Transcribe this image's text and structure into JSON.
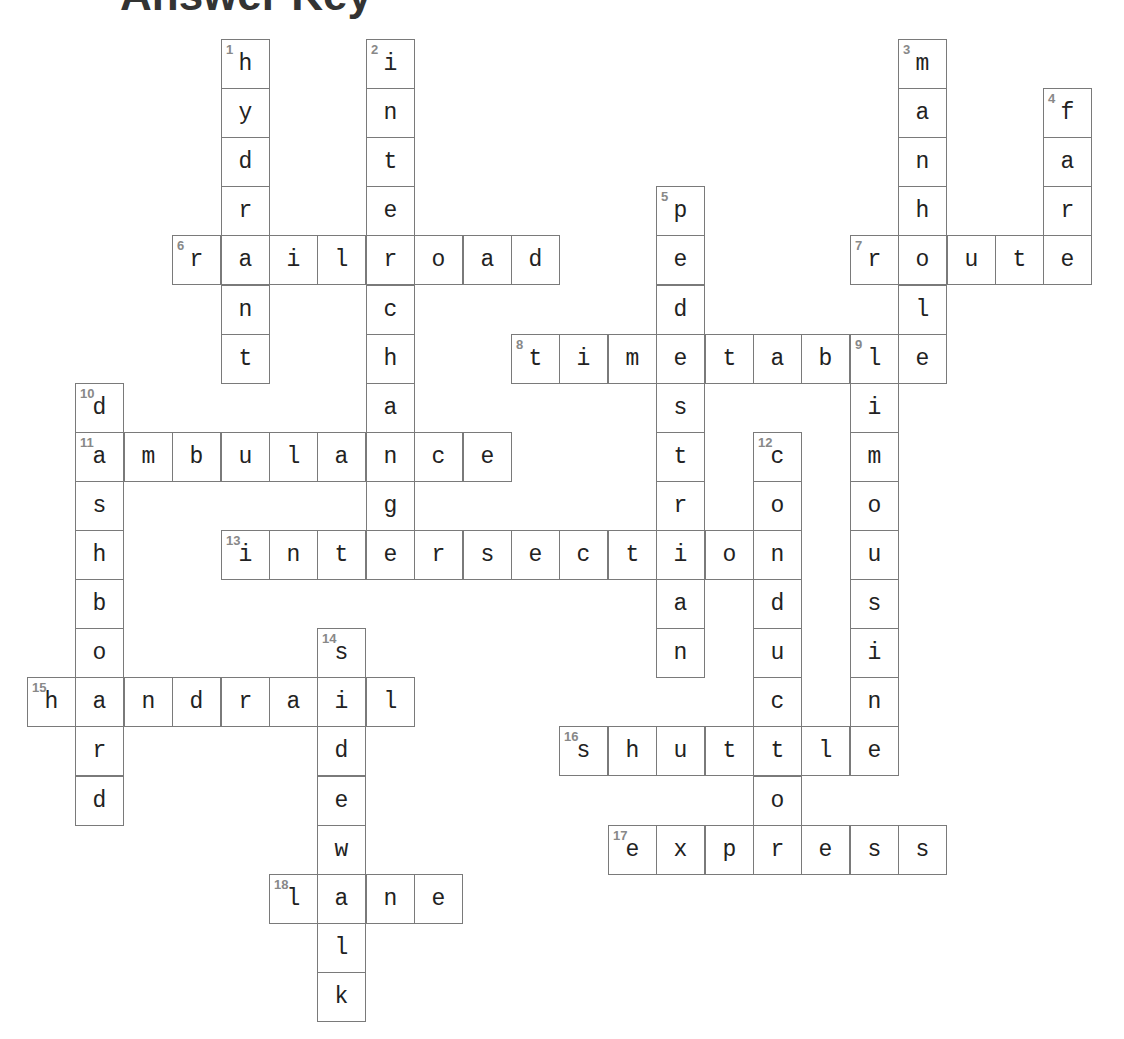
{
  "header": {
    "title_fragment": "Answer Key"
  },
  "grid": {
    "origin_x": 27,
    "origin_y": 39,
    "col_pitch": 48.4,
    "row_pitch": 49.1,
    "colors": {
      "border": "#7a7a7a",
      "letter": "#222222",
      "number": "#888888",
      "background": "#ffffff"
    }
  },
  "words": [
    {
      "number": 1,
      "answer": "hydrant",
      "direction": "down",
      "col": 4,
      "row": 0
    },
    {
      "number": 2,
      "answer": "interchange",
      "direction": "down",
      "col": 7,
      "row": 0
    },
    {
      "number": 3,
      "answer": "manhole",
      "direction": "down",
      "col": 18,
      "row": 0
    },
    {
      "number": 4,
      "answer": "fare",
      "direction": "down",
      "col": 21,
      "row": 1
    },
    {
      "number": 5,
      "answer": "pedestrian",
      "direction": "down",
      "col": 13,
      "row": 3
    },
    {
      "number": 6,
      "answer": "railroad",
      "direction": "across",
      "col": 3,
      "row": 4
    },
    {
      "number": 7,
      "answer": "route",
      "direction": "across",
      "col": 17,
      "row": 4
    },
    {
      "number": 8,
      "answer": "timetable",
      "direction": "across",
      "col": 10,
      "row": 6
    },
    {
      "number": 9,
      "answer": "limousine",
      "direction": "down",
      "col": 17,
      "row": 6
    },
    {
      "number": 10,
      "answer": "dashboard",
      "direction": "down",
      "col": 1,
      "row": 7
    },
    {
      "number": 11,
      "answer": "ambulance",
      "direction": "across",
      "col": 1,
      "row": 8
    },
    {
      "number": 12,
      "answer": "conductor",
      "direction": "down",
      "col": 15,
      "row": 8
    },
    {
      "number": 13,
      "answer": "intersection",
      "direction": "across",
      "col": 4,
      "row": 10
    },
    {
      "number": 14,
      "answer": "sidewalk",
      "direction": "down",
      "col": 6,
      "row": 12
    },
    {
      "number": 15,
      "answer": "handrail",
      "direction": "across",
      "col": 0,
      "row": 13
    },
    {
      "number": 16,
      "answer": "shuttle",
      "direction": "across",
      "col": 11,
      "row": 14
    },
    {
      "number": 17,
      "answer": "express",
      "direction": "across",
      "col": 12,
      "row": 16
    },
    {
      "number": 18,
      "answer": "lane",
      "direction": "across",
      "col": 5,
      "row": 17
    }
  ]
}
